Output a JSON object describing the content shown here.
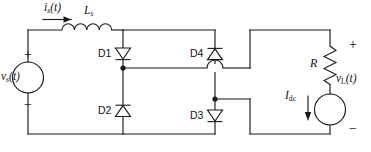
{
  "figure": {
    "type": "circuit-schematic",
    "background_color": "#ffffff",
    "line_color": "#1a1a1a"
  },
  "labels": {
    "source_current": {
      "base": "i",
      "sub": "s",
      "suffix": "(t)"
    },
    "source_inductor": {
      "base": "L",
      "sub": "s"
    },
    "source_voltage": {
      "base": "v",
      "sub": "s",
      "suffix": "(t)"
    },
    "load_voltage": {
      "base": "v",
      "sub": "L",
      "suffix": "(t)"
    },
    "load_resistor": {
      "base": "R"
    },
    "dc_current_source": {
      "base": "I",
      "sub": "dc"
    },
    "diode_1": "D1",
    "diode_2": "D2",
    "diode_3": "D3",
    "diode_4": "D4",
    "source_plus": "+",
    "source_minus": "−",
    "load_plus": "+",
    "load_minus": "−"
  },
  "components": [
    {
      "name": "voltage-source-vs",
      "kind": "ac-voltage-source",
      "symbol": "circle"
    },
    {
      "name": "inductor-ls",
      "kind": "inductor",
      "symbol": "coil",
      "turns": 4
    },
    {
      "name": "diode-d1",
      "kind": "diode",
      "direction": "down"
    },
    {
      "name": "diode-d2",
      "kind": "diode",
      "direction": "up"
    },
    {
      "name": "diode-d3",
      "kind": "diode",
      "direction": "down"
    },
    {
      "name": "diode-d4",
      "kind": "diode",
      "direction": "up"
    },
    {
      "name": "resistor-r",
      "kind": "resistor",
      "symbol": "zigzag",
      "orientation": "vertical"
    },
    {
      "name": "current-source-idc",
      "kind": "dc-current-source",
      "symbol": "circle"
    }
  ]
}
